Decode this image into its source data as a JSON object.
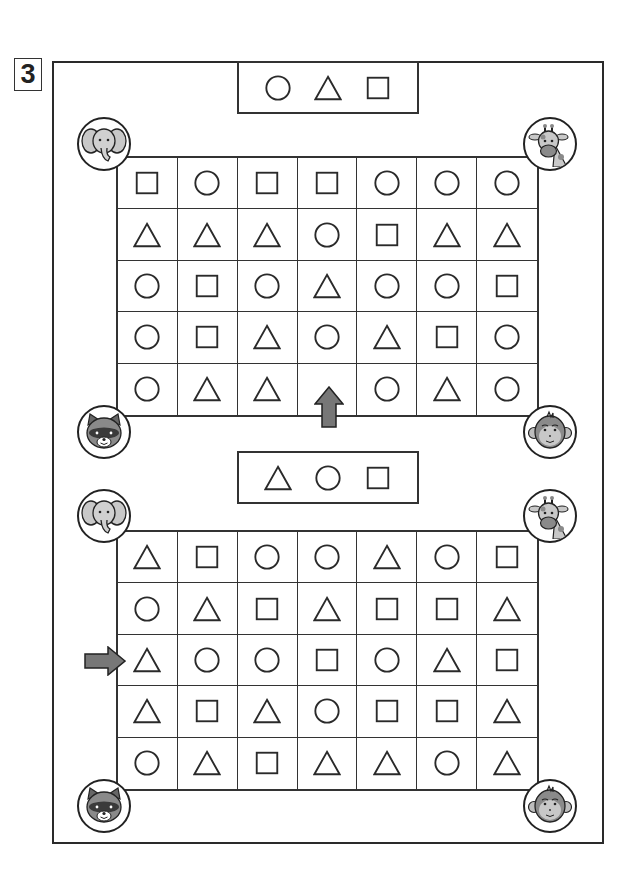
{
  "page": {
    "exercise_number": "3",
    "colors": {
      "line": "#333333",
      "arrow_fill": "#777777",
      "animal_fill": "#bdbdbd",
      "animal_dark": "#555555"
    }
  },
  "puzzles": [
    {
      "key_sequence": [
        "circle",
        "triangle",
        "square"
      ],
      "corner_animals": {
        "top_left": "elephant",
        "top_right": "giraffe",
        "bottom_left": "raccoon",
        "bottom_right": "monkey"
      },
      "start_arrow": {
        "direction": "up",
        "row": 5,
        "col": 4
      },
      "grid": [
        [
          "square",
          "circle",
          "square",
          "square",
          "circle",
          "circle",
          "circle"
        ],
        [
          "triangle",
          "triangle",
          "triangle",
          "circle",
          "square",
          "triangle",
          "triangle"
        ],
        [
          "circle",
          "square",
          "circle",
          "triangle",
          "circle",
          "circle",
          "square"
        ],
        [
          "circle",
          "square",
          "triangle",
          "circle",
          "triangle",
          "square",
          "circle"
        ],
        [
          "circle",
          "triangle",
          "triangle",
          "",
          "circle",
          "triangle",
          "circle"
        ]
      ]
    },
    {
      "key_sequence": [
        "triangle",
        "circle",
        "square"
      ],
      "corner_animals": {
        "top_left": "elephant",
        "top_right": "giraffe",
        "bottom_left": "raccoon",
        "bottom_right": "monkey"
      },
      "start_arrow": {
        "direction": "right",
        "row": 3,
        "col": 1
      },
      "grid": [
        [
          "triangle",
          "square",
          "circle",
          "circle",
          "triangle",
          "circle",
          "square"
        ],
        [
          "circle",
          "triangle",
          "square",
          "triangle",
          "square",
          "square",
          "triangle"
        ],
        [
          "triangle",
          "circle",
          "circle",
          "square",
          "circle",
          "triangle",
          "square"
        ],
        [
          "triangle",
          "square",
          "triangle",
          "circle",
          "square",
          "square",
          "triangle"
        ],
        [
          "circle",
          "triangle",
          "square",
          "triangle",
          "triangle",
          "circle",
          "triangle"
        ]
      ]
    }
  ]
}
